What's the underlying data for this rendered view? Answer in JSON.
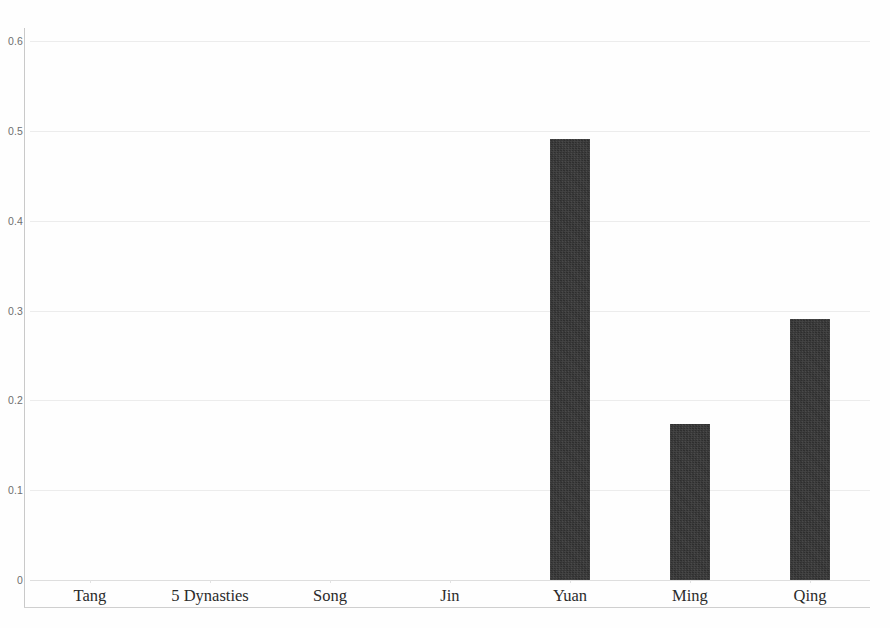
{
  "chart_data": {
    "type": "bar",
    "title": "",
    "subtitle": "",
    "xlabel": "",
    "ylabel": "",
    "categories": [
      "Tang",
      "5 Dynasties",
      "Song",
      "Jin",
      "Yuan",
      "Ming",
      "Qing"
    ],
    "values": [
      0,
      0,
      0,
      0,
      0.491,
      0.174,
      0.29
    ],
    "ylim": [
      0,
      0.6
    ],
    "yticks": [
      0,
      0.1,
      0.2,
      0.3,
      0.4,
      0.5,
      0.6
    ],
    "ytick_labels": [
      "0",
      "0.1",
      "0.2",
      "0.3",
      "0.4",
      "0.5",
      "0.6"
    ],
    "grid": true,
    "grid_axis": "y",
    "legend": null,
    "legend_position": "none",
    "bar_color": "#2e2e2e",
    "gridline_color": "#ececec",
    "axis_color": "#c9c9c9",
    "background_color": "#fefefe",
    "annotations": []
  },
  "axes": {
    "y_axis_name": "y-axis",
    "x_axis_name": "x-axis"
  }
}
